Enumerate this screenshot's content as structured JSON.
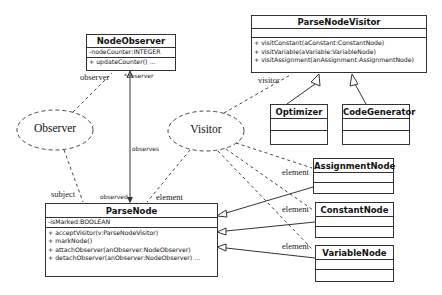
{
  "diagram": {
    "type": "UML class diagram",
    "classes": {
      "node_observer": {
        "name": "NodeObserver",
        "attributes": [
          "-nodeCounter:INTEGER"
        ],
        "operations": [
          "+ updateCounter() ..."
        ]
      },
      "parse_node_visitor": {
        "name": "ParseNodeVisitor",
        "attributes": [],
        "operations": [
          "+ visitConstant(aConstant:ConstantNode)",
          "+ visitVariable(aVariable:VariableNode)",
          "+ visitAssignment(anAssignment:AssignmentNode)"
        ]
      },
      "optimizer": {
        "name": "Optimizer"
      },
      "code_generator": {
        "name": "CodeGenerator"
      },
      "parse_node": {
        "name": "ParseNode",
        "attributes": [
          "-isMarked:BOOLEAN"
        ],
        "operations": [
          "+ acceptVisitor(v:ParseNodeVisitor)",
          "+ markNode()",
          "+ attachObserver(anObserver:NodeObserver)",
          "+ detachObserver(anObserver:NodeObserver) ..."
        ]
      },
      "assignment_node": {
        "name": "AssignmentNode"
      },
      "constant_node": {
        "name": "ConstantNode"
      },
      "variable_node": {
        "name": "VariableNode"
      }
    },
    "patterns": {
      "observer": "Observer",
      "visitor": "Visitor"
    },
    "role_labels": {
      "observer_role": "observer",
      "observer_star": "*observer",
      "observes": "observes",
      "observed": "observed",
      "subject": "subject",
      "visitor_role": "visitor",
      "element_parse": "element",
      "element_assignment": "element",
      "element_constant": "element",
      "element_variable": "element"
    }
  }
}
